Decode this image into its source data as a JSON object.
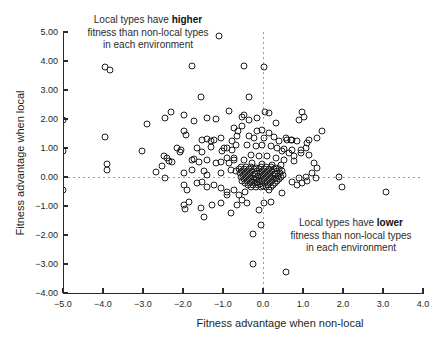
{
  "figure": {
    "x_axis": {
      "title": "Fitness advantage when non-local",
      "tick_values": [
        -5,
        -4,
        -3,
        -2,
        -1,
        0,
        1,
        2,
        3,
        4
      ],
      "tick_labels": [
        "−5.0",
        "−4.0",
        "−3.0",
        "−2.0",
        "−1.0",
        "0.0",
        "1.0",
        "2.0",
        "3.0",
        "4.0"
      ]
    },
    "y_axis": {
      "title": "Fitness advantage when local",
      "tick_values": [
        5,
        4,
        3,
        2,
        1,
        0,
        -1,
        -2,
        -3,
        -4
      ],
      "tick_labels": [
        "5.00",
        "4.00",
        "3.00",
        "2.00",
        "1.00",
        "0.00",
        "−1.00",
        "−2.00",
        "−3.00",
        "−4.00"
      ]
    },
    "annotations": {
      "top": {
        "pre": "Local types have ",
        "bold": "higher",
        "line2": "fitness than non-local types",
        "line3": "in each environment"
      },
      "bottom": {
        "pre": "Local types have ",
        "bold": "lower",
        "line2": "fitness than non-local types",
        "line3": "in each environment"
      }
    }
  },
  "chart_data": {
    "type": "scatter",
    "title": "",
    "xlabel": "Fitness advantage when non-local",
    "ylabel": "Fitness advantage when local",
    "xlim": [
      -5,
      4
    ],
    "ylim": [
      -4,
      5
    ],
    "grid": false,
    "reference_lines": {
      "vertical_x": 0,
      "horizontal_y": 0,
      "style": "dashed",
      "color": "#9b9b9b"
    },
    "marker": {
      "shape": "open-circle",
      "size_px": 7,
      "stroke": "#1f1f1f"
    },
    "points": [
      [
        -1.1,
        4.85
      ],
      [
        -3.95,
        3.8
      ],
      [
        -3.82,
        3.68
      ],
      [
        -1.78,
        3.83
      ],
      [
        -0.48,
        3.83
      ],
      [
        0.03,
        3.79
      ],
      [
        -1.55,
        2.76
      ],
      [
        -0.35,
        2.76
      ],
      [
        -2.45,
        2.03
      ],
      [
        -2.3,
        2.24
      ],
      [
        -1.98,
        2.14
      ],
      [
        -1.73,
        1.93
      ],
      [
        -1.4,
        2.03
      ],
      [
        -1.18,
        2.0
      ],
      [
        -0.85,
        2.28
      ],
      [
        -0.48,
        2.14
      ],
      [
        0.05,
        2.24
      ],
      [
        0.15,
        2.21
      ],
      [
        -0.15,
        2.03
      ],
      [
        -0.35,
        1.97
      ],
      [
        -0.52,
        2.07
      ],
      [
        0.9,
        1.97
      ],
      [
        1.03,
        2.07
      ],
      [
        0.98,
        2.24
      ],
      [
        -2.9,
        1.83
      ],
      [
        -3.95,
        1.38
      ],
      [
        -0.53,
        1.76
      ],
      [
        -0.62,
        1.59
      ],
      [
        0.33,
        1.86
      ],
      [
        -0.73,
        1.69
      ],
      [
        -1.93,
        1.45
      ],
      [
        -1.98,
        1.59
      ],
      [
        1.48,
        1.59
      ],
      [
        -0.65,
        1.41
      ],
      [
        -1.53,
        1.28
      ],
      [
        -1.4,
        1.31
      ],
      [
        -1.3,
        1.24
      ],
      [
        -1.23,
        1.28
      ],
      [
        -1.05,
        1.34
      ],
      [
        -0.78,
        1.24
      ],
      [
        -0.68,
        1.1
      ],
      [
        1.15,
        1.28
      ],
      [
        1.35,
        1.34
      ],
      [
        1.1,
        1.17
      ],
      [
        -0.15,
        1.59
      ],
      [
        -0.03,
        1.62
      ],
      [
        0.15,
        1.52
      ],
      [
        -0.35,
        1.41
      ],
      [
        -0.23,
        1.34
      ],
      [
        0.03,
        1.34
      ],
      [
        0.28,
        1.38
      ],
      [
        0.58,
        1.34
      ],
      [
        0.7,
        1.28
      ],
      [
        0.85,
        1.24
      ],
      [
        0.6,
        1.28
      ],
      [
        0.73,
        1.28
      ],
      [
        0.4,
        1.24
      ],
      [
        -3.03,
        0.9
      ],
      [
        -2.15,
        1.0
      ],
      [
        -2.05,
        0.93
      ],
      [
        -2.08,
        0.86
      ],
      [
        -1.65,
        1.0
      ],
      [
        -1.53,
        0.86
      ],
      [
        -1.3,
        1.03
      ],
      [
        -0.98,
        1.0
      ],
      [
        -0.9,
        1.0
      ],
      [
        -1.03,
        0.9
      ],
      [
        -0.78,
        0.93
      ],
      [
        -0.4,
        1.1
      ],
      [
        -0.18,
        1.07
      ],
      [
        -0.03,
        1.1
      ],
      [
        0.2,
        1.07
      ],
      [
        0.35,
        1.0
      ],
      [
        0.53,
        0.97
      ],
      [
        0.73,
        0.93
      ],
      [
        0.95,
        0.83
      ],
      [
        1.08,
        1.0
      ],
      [
        0.95,
        0.93
      ],
      [
        0.48,
        0.9
      ],
      [
        0.65,
        0.83
      ],
      [
        -3.9,
        0.45
      ],
      [
        -3.9,
        0.24
      ],
      [
        -2.48,
        0.72
      ],
      [
        -2.4,
        0.66
      ],
      [
        -2.35,
        0.55
      ],
      [
        -2.28,
        0.52
      ],
      [
        -2.53,
        0.38
      ],
      [
        -1.78,
        0.59
      ],
      [
        -1.73,
        0.62
      ],
      [
        -1.6,
        0.52
      ],
      [
        -1.4,
        0.59
      ],
      [
        -1.18,
        0.48
      ],
      [
        -1.05,
        0.52
      ],
      [
        -0.85,
        0.48
      ],
      [
        -0.73,
        0.59
      ],
      [
        -0.73,
        0.66
      ],
      [
        -0.9,
        0.66
      ],
      [
        -0.3,
        0.76
      ],
      [
        -0.1,
        0.72
      ],
      [
        0.1,
        0.72
      ],
      [
        0.33,
        0.66
      ],
      [
        0.53,
        0.59
      ],
      [
        0.78,
        0.55
      ],
      [
        -0.48,
        0.59
      ],
      [
        -0.28,
        0.48
      ],
      [
        -0.03,
        0.45
      ],
      [
        0.23,
        0.41
      ],
      [
        0.45,
        0.41
      ],
      [
        1.15,
        0.76
      ],
      [
        1.28,
        0.48
      ],
      [
        1.35,
        0.31
      ],
      [
        0.78,
        0.72
      ],
      [
        -2.68,
        0.17
      ],
      [
        -2.45,
        -0.03
      ],
      [
        -1.98,
        0.14
      ],
      [
        -1.78,
        0.24
      ],
      [
        -1.48,
        0.21
      ],
      [
        -1.4,
        0.07
      ],
      [
        -1.05,
        0.14
      ],
      [
        -0.8,
        0.24
      ],
      [
        -0.68,
        0.21
      ],
      [
        1.23,
        0.14
      ],
      [
        1.08,
        0.0
      ],
      [
        1.33,
        -0.03
      ],
      [
        1.9,
        0.0
      ],
      [
        -1.98,
        -0.28
      ],
      [
        -1.9,
        -0.45
      ],
      [
        -1.65,
        -0.21
      ],
      [
        -1.53,
        -0.17
      ],
      [
        -1.4,
        -0.34
      ],
      [
        -1.23,
        -0.28
      ],
      [
        -1.05,
        -0.38
      ],
      [
        -0.9,
        -0.52
      ],
      [
        -0.73,
        -0.45
      ],
      [
        -0.9,
        -0.62
      ],
      [
        0.73,
        -0.17
      ],
      [
        0.85,
        -0.28
      ],
      [
        0.98,
        -0.21
      ],
      [
        1.1,
        -0.14
      ],
      [
        0.48,
        -0.55
      ],
      [
        0.15,
        -0.45
      ],
      [
        -0.6,
        -0.62
      ],
      [
        -0.53,
        -0.79
      ],
      [
        -0.45,
        -0.52
      ],
      [
        -0.4,
        -0.9
      ],
      [
        0.9,
        -0.03
      ],
      [
        1.98,
        -0.34
      ],
      [
        3.08,
        -0.5
      ],
      [
        -1.98,
        -0.97
      ],
      [
        -1.95,
        -1.1
      ],
      [
        -1.85,
        -0.86
      ],
      [
        -1.55,
        -1.07
      ],
      [
        -1.48,
        -1.38
      ],
      [
        -1.28,
        -0.97
      ],
      [
        -1.05,
        -0.9
      ],
      [
        -0.8,
        -1.24
      ],
      [
        -0.65,
        -0.97
      ],
      [
        0.03,
        -0.9
      ],
      [
        0.2,
        -0.86
      ],
      [
        -0.1,
        -1.14
      ],
      [
        -0.05,
        -1.66
      ],
      [
        -0.25,
        -1.97
      ],
      [
        -0.25,
        -3.0
      ],
      [
        0.58,
        -3.28
      ],
      [
        -5.0,
        1.95
      ],
      [
        -5.0,
        0.9
      ],
      [
        -5.0,
        -0.45
      ],
      [
        -0.55,
        0.35
      ],
      [
        -0.42,
        0.33
      ],
      [
        -0.3,
        0.36
      ],
      [
        -0.18,
        0.32
      ],
      [
        -0.05,
        0.35
      ],
      [
        0.08,
        0.33
      ],
      [
        0.2,
        0.36
      ],
      [
        0.33,
        0.32
      ],
      [
        -0.6,
        0.28
      ],
      [
        -0.48,
        0.27
      ],
      [
        -0.35,
        0.29
      ],
      [
        -0.22,
        0.26
      ],
      [
        -0.1,
        0.28
      ],
      [
        0.02,
        0.27
      ],
      [
        0.15,
        0.29
      ],
      [
        0.28,
        0.26
      ],
      [
        0.4,
        0.28
      ],
      [
        -0.52,
        0.21
      ],
      [
        -0.4,
        0.2
      ],
      [
        -0.27,
        0.22
      ],
      [
        -0.15,
        0.19
      ],
      [
        -0.02,
        0.21
      ],
      [
        0.1,
        0.2
      ],
      [
        0.22,
        0.22
      ],
      [
        0.35,
        0.19
      ],
      [
        0.48,
        0.21
      ],
      [
        -0.58,
        0.14
      ],
      [
        -0.45,
        0.13
      ],
      [
        -0.32,
        0.15
      ],
      [
        -0.2,
        0.12
      ],
      [
        -0.07,
        0.14
      ],
      [
        0.05,
        0.13
      ],
      [
        0.18,
        0.15
      ],
      [
        0.3,
        0.12
      ],
      [
        0.43,
        0.14
      ],
      [
        -0.5,
        0.07
      ],
      [
        -0.38,
        0.06
      ],
      [
        -0.25,
        0.08
      ],
      [
        -0.12,
        0.05
      ],
      [
        0.0,
        0.07
      ],
      [
        0.12,
        0.06
      ],
      [
        0.25,
        0.08
      ],
      [
        0.38,
        0.05
      ],
      [
        0.5,
        0.07
      ],
      [
        -0.55,
        0.0
      ],
      [
        -0.43,
        -0.01
      ],
      [
        -0.3,
        0.01
      ],
      [
        -0.17,
        -0.02
      ],
      [
        -0.05,
        0.0
      ],
      [
        0.07,
        -0.01
      ],
      [
        0.2,
        0.01
      ],
      [
        0.32,
        -0.02
      ],
      [
        0.45,
        0.0
      ],
      [
        -0.48,
        -0.07
      ],
      [
        -0.36,
        -0.08
      ],
      [
        -0.23,
        -0.06
      ],
      [
        -0.1,
        -0.09
      ],
      [
        0.02,
        -0.07
      ],
      [
        0.15,
        -0.08
      ],
      [
        0.27,
        -0.06
      ],
      [
        0.4,
        -0.08
      ],
      [
        -0.52,
        -0.14
      ],
      [
        -0.4,
        -0.15
      ],
      [
        -0.28,
        -0.13
      ],
      [
        -0.15,
        -0.16
      ],
      [
        -0.03,
        -0.14
      ],
      [
        0.1,
        -0.15
      ],
      [
        0.22,
        -0.13
      ],
      [
        0.35,
        -0.15
      ],
      [
        -0.45,
        -0.21
      ],
      [
        -0.33,
        -0.22
      ],
      [
        -0.2,
        -0.2
      ],
      [
        -0.08,
        -0.23
      ],
      [
        0.05,
        -0.21
      ],
      [
        0.17,
        -0.22
      ],
      [
        0.3,
        -0.2
      ],
      [
        -0.38,
        -0.28
      ],
      [
        -0.25,
        -0.29
      ],
      [
        -0.13,
        -0.27
      ],
      [
        0.0,
        -0.3
      ],
      [
        0.12,
        -0.28
      ],
      [
        0.25,
        -0.29
      ],
      [
        -0.3,
        -0.35
      ],
      [
        -0.18,
        -0.36
      ],
      [
        -0.05,
        -0.34
      ],
      [
        0.08,
        -0.36
      ],
      [
        0.2,
        -0.35
      ]
    ]
  }
}
